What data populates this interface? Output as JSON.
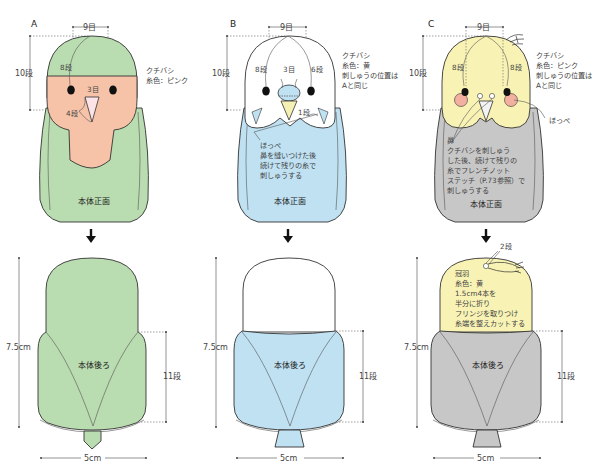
{
  "colors": {
    "A_body": "#b9dcb0",
    "A_face": "#f6c2a8",
    "B_head": "#ffffff",
    "B_body": "#bfe1f2",
    "B_beak": "#f5f0b4",
    "C_head": "#f8f3b4",
    "C_body": "#c7c7c7",
    "C_cheek": "#f3b0a0",
    "beak_pink": "#fbe3e8",
    "outline": "#333333"
  },
  "panels": [
    {
      "id": "A",
      "letter": "A",
      "front": {
        "width_label": "9目",
        "height_label": "10段",
        "eye_label": "8段",
        "beak_label": "3目",
        "beak_height_label": "4段",
        "note_lines": [
          "クチバシ",
          "糸色：ピンク"
        ],
        "body_label": "本体正面"
      },
      "back": {
        "height_label": "7.5cm",
        "side_label": "11段",
        "width_label": "5cm",
        "body_label": "本体後ろ"
      }
    },
    {
      "id": "B",
      "letter": "B",
      "front": {
        "width_label": "9目",
        "height_label": "10段",
        "eye_label_left": "8段",
        "beak_label": "3目",
        "eye_label_right": "6段",
        "cheek_label": "1段",
        "note_lines": [
          "クチバシ",
          "糸色：黄",
          "刺しゅうの位置は",
          "Aと同じ"
        ],
        "body_note_lines": [
          "ほっぺ",
          "鼻を縫いつけた後",
          "続けて残りの糸で",
          "刺しゅうする"
        ],
        "body_label": "本体正面"
      },
      "back": {
        "height_label": "7.5cm",
        "side_label": "11段",
        "width_label": "5cm",
        "body_label": "本体後ろ"
      }
    },
    {
      "id": "C",
      "letter": "C",
      "front": {
        "width_label": "9目",
        "height_label": "10段",
        "eye_label_left": "8段",
        "eye_label_right": "8段",
        "note_lines": [
          "クチバシ",
          "糸色：ピンク",
          "刺しゅうの位置は",
          "Aと同じ"
        ],
        "cheek_label": "ほっぺ",
        "body_note_lines": [
          "鼻",
          "クチバシを刺しゅう",
          "した後、続けて残りの",
          "糸でフレンチノット",
          "ステッチ（P.73参照）で",
          "刺しゅうする"
        ],
        "body_label": "本体正面"
      },
      "back": {
        "crest_rows_label": "2段",
        "crest_note_lines": [
          "冠羽",
          "糸色：黄",
          "1.5cm4本を",
          "半分に折り",
          "フリンジを取りつけ",
          "糸端を整えカットする"
        ],
        "height_label": "7.5cm",
        "side_label": "11段",
        "width_label": "5cm",
        "body_label": "本体後ろ"
      }
    }
  ]
}
